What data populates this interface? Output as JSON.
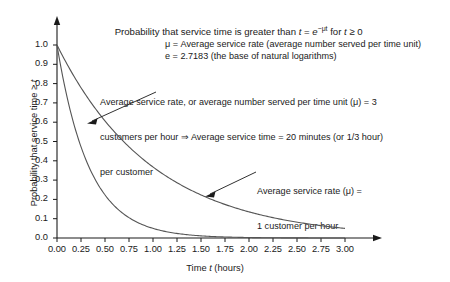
{
  "chart_data": {
    "type": "line",
    "title": "Probability that service time is greater than t = e−μt for t ≥ 0",
    "title_parts": {
      "lead": "Probability that service time is greater than ",
      "var_t": "t",
      "eq": " = ",
      "base_e": "e",
      "exponent": "−μt",
      "tail": " for ",
      "var_t2": "t",
      "cond": " ≥ 0"
    },
    "xlabel": "Time t (hours)",
    "xlabel_parts": {
      "lead": "Time ",
      "var": "t",
      "tail": " (hours)"
    },
    "ylabel": "Probability that service time ≥ t",
    "ylabel_parts": {
      "lead": "Probability that service time ≥ ",
      "var": "t"
    },
    "xlim": [
      0,
      3
    ],
    "ylim": [
      0,
      1
    ],
    "xticks": [
      "0.00",
      "0.25",
      "0.50",
      "0.75",
      "1.00",
      "1.25",
      "1.50",
      "1.75",
      "2.00",
      "2.25",
      "2.50",
      "2.75",
      "3.00"
    ],
    "xtick_values": [
      0,
      0.25,
      0.5,
      0.75,
      1,
      1.25,
      1.5,
      1.75,
      2,
      2.25,
      2.5,
      2.75,
      3
    ],
    "yticks": [
      "0.0",
      "0.1",
      "0.2",
      "0.3",
      "0.4",
      "0.5",
      "0.6",
      "0.7",
      "0.8",
      "0.9",
      "1.0"
    ],
    "ytick_values": [
      0,
      0.1,
      0.2,
      0.3,
      0.4,
      0.5,
      0.6,
      0.7,
      0.8,
      0.9,
      1
    ],
    "grid": false,
    "legend_position": "inline-annotations",
    "series": [
      {
        "name": "mu = 3 customers per hour",
        "mu": 3,
        "formula": "e^(-3t)",
        "x": [
          0,
          0.25,
          0.5,
          0.75,
          1,
          1.25,
          1.5,
          1.75,
          2,
          2.25,
          2.5,
          2.75,
          3
        ],
        "values": [
          1.0,
          0.472,
          0.223,
          0.105,
          0.05,
          0.024,
          0.011,
          0.005,
          0.002,
          0.001,
          0.001,
          0.0,
          0.0
        ]
      },
      {
        "name": "mu = 1 customer per hour",
        "mu": 1,
        "formula": "e^(-t)",
        "x": [
          0,
          0.25,
          0.5,
          0.75,
          1,
          1.25,
          1.5,
          1.75,
          2,
          2.25,
          2.5,
          2.75,
          3
        ],
        "values": [
          1.0,
          0.779,
          0.607,
          0.472,
          0.368,
          0.287,
          0.223,
          0.174,
          0.135,
          0.105,
          0.082,
          0.064,
          0.05
        ]
      }
    ],
    "annotations": [
      {
        "id": "mu-definition",
        "lines": [
          "μ = Average service rate (average number served per time unit)",
          "e = 2.7183 (the base of natural logarithms)"
        ]
      },
      {
        "id": "callout-mu-3",
        "lines": [
          "Average service rate, or average number served per time unit (μ) = 3",
          "customers per hour ⇒ Average service time = 20 minutes (or 1/3 hour)",
          "per customer"
        ],
        "points_to_series": "mu = 3 customers per hour"
      },
      {
        "id": "callout-mu-1",
        "lines": [
          "Average service rate (μ) =",
          "1 customer per hour"
        ],
        "points_to_series": "mu = 1 customer per hour"
      }
    ]
  },
  "notes": {
    "mu_line": "μ = Average service rate (average number served per time unit)",
    "e_line": "e = 2.7183 (the base of natural logarithms)",
    "callout_mu3_l1": "Average service rate, or average number served per time unit (μ) = 3",
    "callout_mu3_l2": "customers per hour ⇒ Average service time = 20 minutes (or 1/3 hour)",
    "callout_mu3_l3": "per customer",
    "callout_mu1_l1": "Average service rate (μ) =",
    "callout_mu1_l2": "1 customer per hour"
  },
  "colors": {
    "axis": "#1a1a1a",
    "curve": "#555555",
    "background": "#ffffff",
    "text": "#1a1a1a"
  }
}
